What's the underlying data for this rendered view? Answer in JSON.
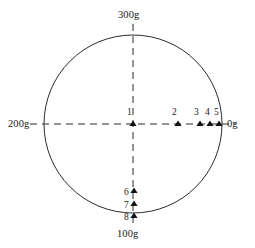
{
  "figure": {
    "title": "",
    "type": "azimuth-circle-diagram",
    "units": "gon",
    "circle": {
      "cx": 133,
      "cy": 124,
      "r": 89,
      "stroke": "#2b2b2b"
    },
    "axes": {
      "style": "dashed",
      "stroke": "#2b2b2b",
      "horizontal": {
        "x1": 30,
        "y1": 124,
        "x2": 236,
        "y2": 124
      },
      "vertical": {
        "x1": 133,
        "y1": 24,
        "x2": 133,
        "y2": 224
      }
    },
    "cardinal_labels": [
      {
        "id": "top",
        "text": "300g",
        "x": 118,
        "y": 10,
        "align": "left"
      },
      {
        "id": "left",
        "text": "200g",
        "x": 8,
        "y": 119,
        "align": "left"
      },
      {
        "id": "right",
        "text": "0g",
        "x": 227,
        "y": 119,
        "align": "left"
      },
      {
        "id": "bottom",
        "text": "100g",
        "x": 117,
        "y": 229,
        "align": "left"
      }
    ],
    "markers": [
      {
        "id": 1,
        "label": "1",
        "x": 133,
        "y": 126,
        "label_x": 127,
        "label_y": 108
      },
      {
        "id": 2,
        "label": "2",
        "x": 178,
        "y": 126,
        "label_x": 172,
        "label_y": 108
      },
      {
        "id": 3,
        "label": "3",
        "x": 200,
        "y": 126,
        "label_x": 194,
        "label_y": 108
      },
      {
        "id": 4,
        "label": "4",
        "x": 210,
        "y": 126,
        "label_x": 205,
        "label_y": 108
      },
      {
        "id": 5,
        "label": "5",
        "x": 219,
        "y": 126,
        "label_x": 214,
        "label_y": 108
      },
      {
        "id": 6,
        "label": "6",
        "x": 134,
        "y": 193,
        "label_x": 124,
        "label_y": 188
      },
      {
        "id": 7,
        "label": "7",
        "x": 134,
        "y": 206,
        "label_x": 124,
        "label_y": 201
      },
      {
        "id": 8,
        "label": "8",
        "x": 134,
        "y": 218,
        "label_x": 124,
        "label_y": 213
      }
    ],
    "marker_glyph": "triangle-up",
    "marker_color": "#111111"
  },
  "chart_data": {
    "type": "scatter",
    "title": "",
    "xlabel": "",
    "ylabel": "",
    "coordinate_system": "azimuth circle in gon (400g full turn)",
    "axis_tick_labels": [
      "0g",
      "100g",
      "200g",
      "300g"
    ],
    "axis_tick_positions_deg": [
      0,
      90,
      180,
      270
    ],
    "grid": false,
    "legend": "none",
    "series": [
      {
        "name": "points",
        "points": [
          {
            "label": "1",
            "azimuth_g": 0,
            "radius_fraction": 0.0
          },
          {
            "label": "2",
            "azimuth_g": 0,
            "radius_fraction": 0.51
          },
          {
            "label": "3",
            "azimuth_g": 0,
            "radius_fraction": 0.75
          },
          {
            "label": "4",
            "azimuth_g": 0,
            "radius_fraction": 0.87
          },
          {
            "label": "5",
            "azimuth_g": 0,
            "radius_fraction": 0.97
          },
          {
            "label": "6",
            "azimuth_g": 100,
            "radius_fraction": 0.78
          },
          {
            "label": "7",
            "azimuth_g": 100,
            "radius_fraction": 0.92
          },
          {
            "label": "8",
            "azimuth_g": 100,
            "radius_fraction": 1.0
          }
        ]
      }
    ]
  }
}
